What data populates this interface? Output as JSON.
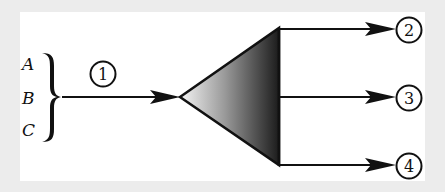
{
  "diagram": {
    "inputs": [
      {
        "label": "A"
      },
      {
        "label": "B"
      },
      {
        "label": "C"
      }
    ],
    "input_node": {
      "label": "1"
    },
    "outputs": [
      {
        "label": "2"
      },
      {
        "label": "3"
      },
      {
        "label": "4"
      }
    ],
    "colors": {
      "stroke": "#111111",
      "triangle_light": "#f2f2f2",
      "triangle_dark": "#1e1e1e",
      "background": "#ececec",
      "panel": "#ffffff"
    }
  }
}
